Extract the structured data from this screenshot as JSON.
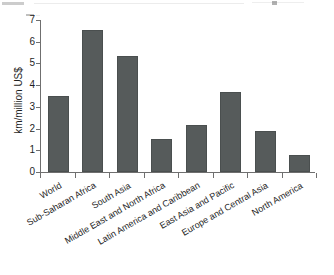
{
  "figure": {
    "background_color": "#ffffff",
    "bar_color": "#565b5b",
    "axis_color": "#6f6f6f",
    "text_color": "#1f1f1f"
  },
  "chart_data": {
    "type": "bar",
    "title": "",
    "subtitle": "",
    "xlabel": "",
    "ylabel": "km/million US$",
    "ylim": [
      0,
      7
    ],
    "yticks": [
      0,
      1,
      2,
      3,
      4,
      5,
      6,
      7
    ],
    "ytick_labels": [
      "0",
      "1",
      "2",
      "3",
      "4",
      "5",
      "6",
      "7"
    ],
    "grid": false,
    "legend": false,
    "legend_position": "none",
    "xtick_label_rotation": -30,
    "categories": [
      "World",
      "Sub-Saharan Africa",
      "South Asia",
      "Middle East and North Africa",
      "Latin America and Caribbean",
      "East Asia and Pacific",
      "Europe and Central Asia",
      "North America"
    ],
    "values": [
      3.5,
      6.55,
      5.35,
      1.52,
      2.15,
      3.68,
      1.9,
      0.8
    ]
  }
}
